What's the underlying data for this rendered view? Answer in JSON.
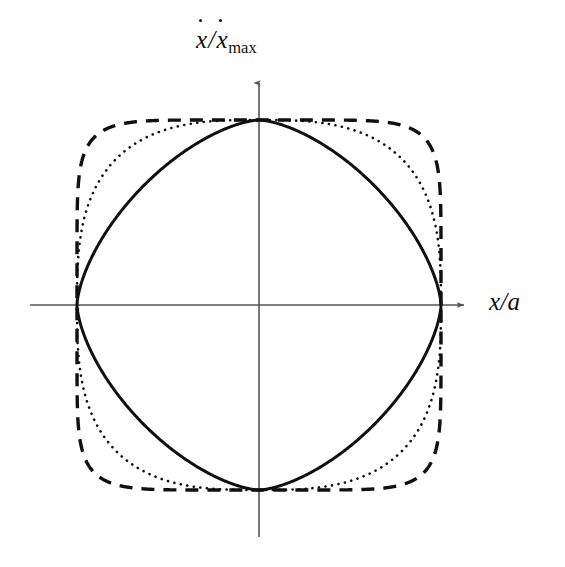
{
  "figure": {
    "kind": "phase-space-portrait",
    "background_color": "#ffffff",
    "ink_color": "#101010",
    "axis_color": "#555555",
    "x_axis_label": "x/a",
    "y_axis_label_numerator": "x",
    "y_axis_label_denominator": "x",
    "y_axis_label_subscript": "max",
    "slash": "/"
  },
  "chart_data": {
    "type": "line",
    "title": "",
    "subtitle": "",
    "xlabel": "x/a",
    "ylabel": "ẋ/ẋ_max",
    "xlim": [
      -1.45,
      1.45
    ],
    "ylim": [
      -1.45,
      1.45
    ],
    "grid": false,
    "legend": "none",
    "annotations": [],
    "tick_labels": {
      "x": [],
      "y": []
    },
    "axes": {
      "x_axis_arrow": "right",
      "y_axis_arrow": "up",
      "origin_label": "",
      "x_axis_pixel_span": [
        30,
        471
      ],
      "y_axis_pixel_span": [
        76,
        537
      ],
      "origin_pixel": [
        259,
        305
      ],
      "unit_pixels_x": 182,
      "unit_pixels_y": 185
    },
    "series": [
      {
        "name": "solid-orbit",
        "style": "solid",
        "color": "#101010",
        "line_width": 3.0,
        "closed": true,
        "shape": "pointed-oval-lens",
        "exponent_n": 1.55,
        "x_intercepts": [
          -1,
          1
        ],
        "y_extrema": [
          -1,
          1
        ],
        "x": [
          1.0,
          0.995,
          0.98,
          0.955,
          0.92,
          0.875,
          0.82,
          0.755,
          0.68,
          0.6,
          0.51,
          0.41,
          0.31,
          0.2,
          0.1,
          0.0,
          -0.1,
          -0.2,
          -0.31,
          -0.41,
          -0.51,
          -0.6,
          -0.68,
          -0.755,
          -0.82,
          -0.875,
          -0.92,
          -0.955,
          -0.98,
          -0.995,
          -1.0
        ],
        "y": [
          0.0,
          0.13,
          0.25,
          0.36,
          0.455,
          0.54,
          0.615,
          0.685,
          0.745,
          0.8,
          0.85,
          0.892,
          0.928,
          0.958,
          0.982,
          1.0,
          0.982,
          0.958,
          0.928,
          0.892,
          0.85,
          0.8,
          0.745,
          0.685,
          0.615,
          0.54,
          0.455,
          0.36,
          0.25,
          0.13,
          0.0
        ]
      },
      {
        "name": "dotted-orbit",
        "style": "dotted",
        "color": "#101010",
        "line_width": 2.6,
        "dot_spacing_px": 6.5,
        "closed": true,
        "shape": "intermediate-superellipse",
        "exponent_n": 2.9,
        "x_intercepts": [
          -1,
          1
        ],
        "y_extrema": [
          -1,
          1
        ],
        "x": [
          1.0,
          0.999,
          0.995,
          0.986,
          0.97,
          0.947,
          0.915,
          0.873,
          0.82,
          0.757,
          0.683,
          0.6,
          0.508,
          0.41,
          0.307,
          0.2,
          0.1,
          0.0
        ],
        "y": [
          0.0,
          0.2,
          0.31,
          0.41,
          0.51,
          0.6,
          0.683,
          0.757,
          0.82,
          0.873,
          0.915,
          0.947,
          0.97,
          0.986,
          0.995,
          0.999,
          1.0,
          1.0
        ]
      },
      {
        "name": "dashed-orbit",
        "style": "dashed",
        "color": "#101010",
        "line_width": 3.4,
        "dash_pattern_px": [
          13,
          9
        ],
        "closed": true,
        "shape": "rounded-square-superellipse",
        "exponent_n": 7.0,
        "x_intercepts": [
          -1,
          1
        ],
        "y_extrema": [
          -1,
          1
        ],
        "x": [
          1.0,
          1.0,
          0.999,
          0.998,
          0.995,
          0.99,
          0.978,
          0.955,
          0.91,
          0.84,
          0.75,
          0.64,
          0.52,
          0.39,
          0.26,
          0.13,
          0.0
        ],
        "y": [
          0.0,
          0.13,
          0.26,
          0.39,
          0.52,
          0.64,
          0.75,
          0.84,
          0.91,
          0.955,
          0.978,
          0.99,
          0.995,
          0.998,
          0.999,
          1.0,
          1.0
        ]
      }
    ]
  }
}
